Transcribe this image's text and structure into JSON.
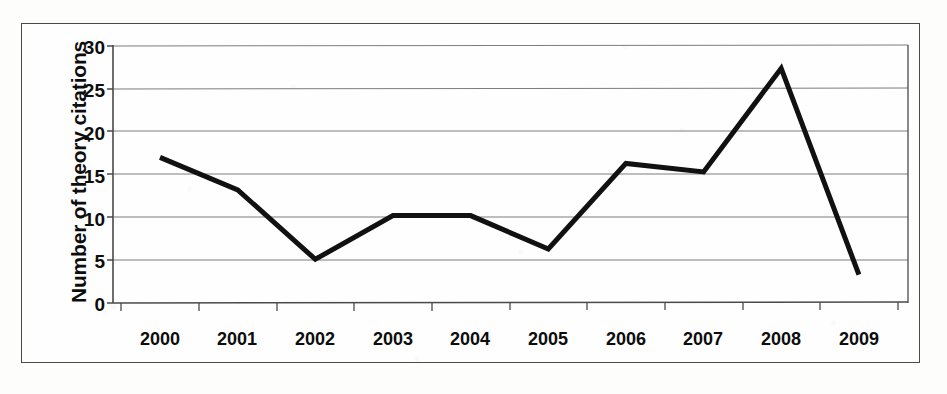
{
  "chart_data": {
    "type": "line",
    "title": "",
    "subtitle": "",
    "xlabel": "",
    "ylabel": "Number of theory citations",
    "categories": [
      "2000",
      "2001",
      "2002",
      "2003",
      "2004",
      "2005",
      "2006",
      "2007",
      "2008",
      "2009"
    ],
    "series": [
      {
        "name": "Number of theory citations",
        "values": [
          17.0,
          13.2,
          5.1,
          10.2,
          10.2,
          6.3,
          16.3,
          15.3,
          27.4,
          3.3
        ],
        "color": "#111111"
      }
    ],
    "ylim": [
      0,
      30
    ],
    "ytick_labels": [
      "0",
      "5",
      "10",
      "15",
      "20",
      "25",
      "30"
    ],
    "ytick_values": [
      0,
      5,
      10,
      15,
      20,
      25,
      30
    ],
    "grid": "horizontal",
    "legend": "none",
    "line_width": 5,
    "markers": "none",
    "border": "outer-rectangle",
    "annotations": []
  },
  "figure": {
    "background_color": "#fefefe",
    "axis_color": "#4a4a4a",
    "gridline_color": "#7d7d7d",
    "text_color": "#0d0d0d"
  }
}
